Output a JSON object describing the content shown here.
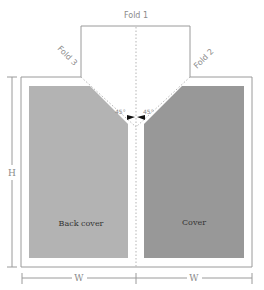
{
  "diagram": {
    "folds": {
      "fold1": "Fold 1",
      "fold2": "Fold 2",
      "fold3": "Fold 3"
    },
    "angles": {
      "left": "45°",
      "right": "45°"
    },
    "panels": {
      "back_cover": {
        "label": "Back cover",
        "color": "#b3b3b3"
      },
      "cover": {
        "label": "Cover",
        "color": "#989898"
      }
    },
    "dimensions": {
      "height": "H",
      "width_left": "W",
      "width_right": "W"
    },
    "colors": {
      "outline": "#9a9a9a",
      "dotted": "#b0b0b0",
      "arrow": "#111111"
    }
  }
}
